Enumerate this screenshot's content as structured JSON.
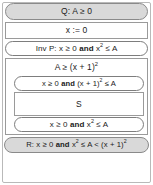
{
  "diagram": {
    "type": "hoare-logic-proof-outline",
    "colors": {
      "shaded_fill": "#d9d9d9",
      "plain_fill": "#ffffff",
      "border": "#7d7d7d",
      "text": "#1b1b1b"
    },
    "nodes": {
      "precondition": {
        "label": "Q: A ≥ 0",
        "shape": "pill",
        "shaded": true,
        "kind": "assertion"
      },
      "initialization": {
        "label": "x := 0",
        "shape": "rectangle",
        "shaded": false,
        "kind": "statement"
      },
      "invariant": {
        "label": "Inv P: x ≥ 0 and x² ≤ A",
        "label_prefix": "Inv P: x ≥ 0 ",
        "label_keyword": "and",
        "label_suffix": " x",
        "label_sup": "2",
        "label_tail": " ≤ A",
        "shape": "pill",
        "shaded": false,
        "kind": "assertion"
      },
      "guard": {
        "label": "A ≥ (x + 1)²",
        "label_main": "A ≥ (x + 1)",
        "label_sup": "2",
        "shape": "rectangle",
        "shaded": false,
        "kind": "loop-guard"
      },
      "inner_pre": {
        "label": "x ≥ 0 and (x + 1)² ≤ A",
        "label_prefix": "x ≥ 0 ",
        "label_keyword": "and",
        "label_mid": " (x + 1)",
        "label_sup": "2",
        "label_tail": " ≤ A",
        "shape": "pill",
        "shaded": false,
        "kind": "assertion"
      },
      "body": {
        "label": "S",
        "shape": "rectangle",
        "shaded": false,
        "kind": "statement"
      },
      "inner_post": {
        "label": "x ≥ 0 and x² ≤ A",
        "label_prefix": "x ≥ 0 ",
        "label_keyword": "and",
        "label_mid": " x",
        "label_sup": "2",
        "label_tail": " ≤ A",
        "shape": "pill",
        "shaded": false,
        "kind": "assertion"
      },
      "postcondition": {
        "label": "R: x ≥ 0 and x² ≤ A < (x + 1)²",
        "label_prefix": "R: x ≥ 0 ",
        "label_keyword": "and",
        "label_mid": " x",
        "label_sup": "2",
        "label_tail": " ≤ A < (x + 1)",
        "label_sup2": "2",
        "shape": "pill",
        "shaded": true,
        "kind": "assertion"
      }
    }
  }
}
